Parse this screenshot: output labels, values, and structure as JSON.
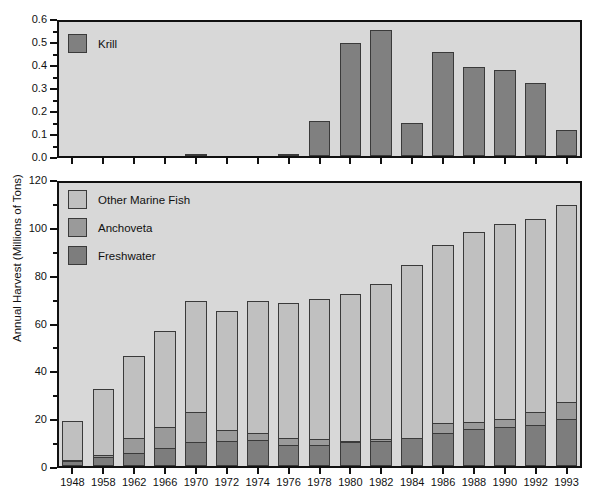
{
  "chart_data": {
    "type": "bar",
    "title": "",
    "xlabel": "",
    "ylabel": "Annual Harvest (Millions of Tons)",
    "categories": [
      "1948",
      "1958",
      "1962",
      "1966",
      "1970",
      "1972",
      "1974",
      "1976",
      "1978",
      "1980",
      "1982",
      "1984",
      "1986",
      "1988",
      "1990",
      "1992",
      "1993"
    ],
    "panels": [
      {
        "name": "krill-panel",
        "ylim": [
          0.0,
          0.6
        ],
        "ytick_labels": [
          "0.0",
          "0.1",
          "0.2",
          "0.3",
          "0.4",
          "0.5",
          "0.6"
        ],
        "ytick_values": [
          0.0,
          0.1,
          0.2,
          0.3,
          0.4,
          0.5,
          0.6
        ],
        "yminor_step": 0.05,
        "grid": false,
        "legend_position": "top-left",
        "series": [
          {
            "name": "Krill",
            "color": "#808080",
            "values": [
              0,
              0,
              0,
              0,
              0.005,
              0,
              0,
              0.01,
              0.155,
              0.505,
              0.565,
              0.15,
              0.465,
              0.4,
              0.385,
              0.325,
              0.115
            ]
          }
        ]
      },
      {
        "name": "fish-harvest-panel",
        "ylim": [
          0,
          120
        ],
        "ytick_labels": [
          "0",
          "20",
          "40",
          "60",
          "80",
          "100",
          "120"
        ],
        "ytick_values": [
          0,
          20,
          40,
          60,
          80,
          100,
          120
        ],
        "yminor_step": 10,
        "grid": false,
        "stacked": true,
        "legend_position": "top-left",
        "series": [
          {
            "name": "Freshwater",
            "color": "#7d7d7d",
            "values": [
              2,
              4,
              5.5,
              7.5,
              10,
              10.5,
              11,
              9,
              9,
              10,
              10.5,
              12,
              14,
              15.5,
              16.5,
              17.5,
              20
            ]
          },
          {
            "name": "Anchoveta",
            "color": "#9a9a9a",
            "values": [
              1,
              1,
              7,
              9.5,
              13.5,
              5,
              3.5,
              3.5,
              3,
              1,
              1.5,
              0,
              4.5,
              3.5,
              4,
              6,
              7.5
            ]
          },
          {
            "name": "Other Marine Fish",
            "color": "#c0c0c0",
            "values": [
              17,
              28.5,
              35,
              41,
              47.5,
              51,
              56.5,
              57.5,
              59.5,
              63,
              66,
              73.5,
              76,
              81,
              83,
              82,
              84
            ]
          }
        ],
        "totals": [
          20,
          33.5,
          47.5,
          58,
          71,
          66.5,
          71,
          70,
          71.5,
          74,
          78,
          85.5,
          94.5,
          100,
          103.5,
          105.5,
          111.5
        ]
      }
    ]
  },
  "legends": {
    "krill": [
      {
        "label": "Krill",
        "color": "#808080"
      }
    ],
    "harvest": [
      {
        "label": "Other Marine Fish",
        "color": "#c0c0c0"
      },
      {
        "label": "Anchoveta",
        "color": "#9a9a9a"
      },
      {
        "label": "Freshwater",
        "color": "#7d7d7d"
      }
    ]
  },
  "axis": {
    "ylabel": "Annual Harvest (Millions of Tons)"
  }
}
